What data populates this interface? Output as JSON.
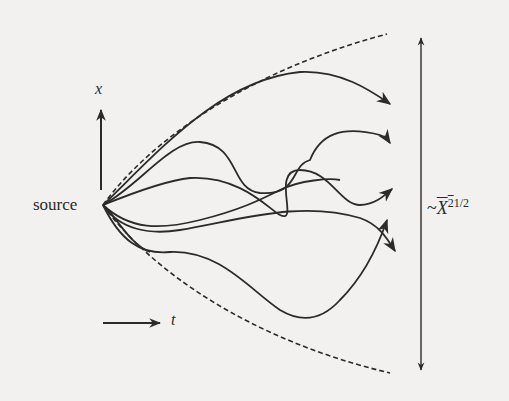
{
  "diagram": {
    "labels": {
      "source": "source",
      "x_axis": "x",
      "t_axis": "t",
      "spread_prefix": "~",
      "spread_var": "X",
      "spread_exp": "2",
      "spread_power": "1/2"
    },
    "elements": {
      "envelope": "dashed parabolic envelope (upper and lower)",
      "trajectories": 6,
      "spread_arrow": "double-headed vertical arrow indicating spread"
    },
    "colors": {
      "background": "#f2f1ef",
      "ink": "#2b2b2b"
    }
  }
}
